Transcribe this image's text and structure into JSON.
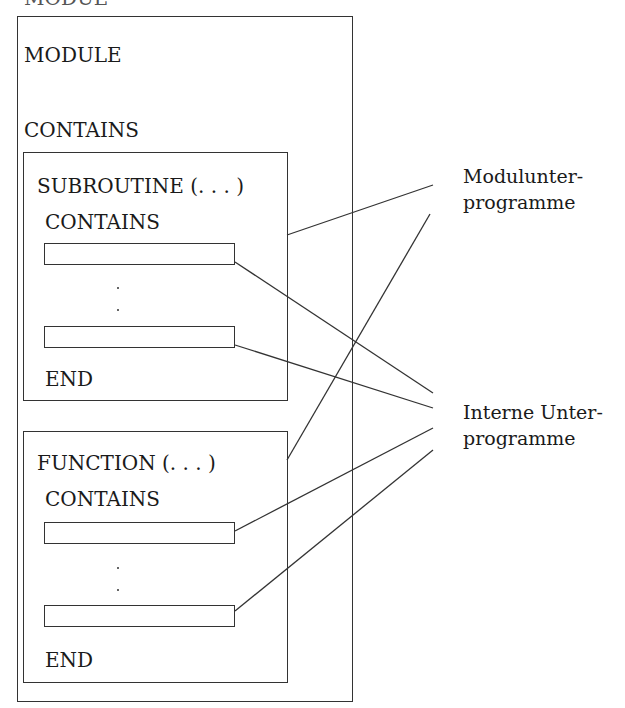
{
  "diagram": {
    "top_cut_text": "MODUL",
    "module": {
      "header": "MODULE",
      "contains": "CONTAINS"
    },
    "subroutine": {
      "header": "SUBROUTINE (. . . )",
      "contains": "CONTAINS",
      "ellipsis": ":",
      "end": "END"
    },
    "function": {
      "header": "FUNCTION (. . . )",
      "contains": "CONTAINS",
      "ellipsis": ":",
      "end": "END"
    },
    "labels": {
      "module_procedures_line1": "Modulunter-",
      "module_procedures_line2": "programme",
      "internal_procedures_line1": "Interne Unter-",
      "internal_procedures_line2": "programme"
    }
  }
}
